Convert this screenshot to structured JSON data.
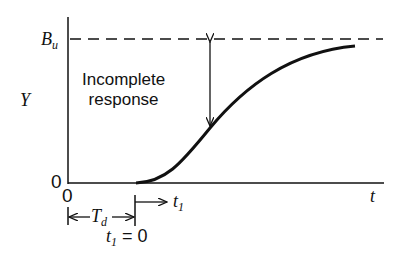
{
  "diagram": {
    "y_axis_label": "Y",
    "x_axis_label": "t",
    "upper_bound_label": "B",
    "upper_bound_subscript": "u",
    "origin_y_label": "0",
    "origin_x_label": "0",
    "annotation_line1": "Incomplete",
    "annotation_line2": "response",
    "delay_label": "T",
    "delay_subscript": "d",
    "shifted_time_label": "t",
    "shifted_time_subscript": "1",
    "shifted_zero_label": "t",
    "shifted_zero_subscript": "1",
    "shifted_zero_value": " = 0"
  }
}
